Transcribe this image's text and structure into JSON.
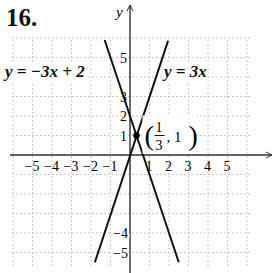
{
  "problem": {
    "number": "16."
  },
  "labels": {
    "eq1": "y = −3x + 2",
    "eq2": "y = 3x",
    "point": "(1/3, 1)",
    "point_num": "1",
    "point_den": "3",
    "point_y": "1",
    "y_axis": "y",
    "x_axis": "x"
  },
  "chart_data": {
    "type": "line",
    "title": "16.",
    "xlabel": "x",
    "ylabel": "y",
    "xlim": [
      -6,
      6
    ],
    "ylim": [
      -5.6,
      6
    ],
    "grid": true,
    "x_tick_labels": [
      "-5",
      "-4",
      "-3",
      "-2",
      "-1",
      "1",
      "2",
      "3",
      "4",
      "5"
    ],
    "y_tick_labels": [
      "5",
      "3",
      "2",
      "1",
      "-4",
      "-5"
    ],
    "series": [
      {
        "name": "y = -3x + 2",
        "slope": -3,
        "intercept": 2,
        "x": [
          -1.3,
          2.5
        ],
        "y": [
          5.9,
          -5.5
        ]
      },
      {
        "name": "y = 3x",
        "slope": 3,
        "intercept": 0,
        "x": [
          -1.8,
          1.95
        ],
        "y": [
          -5.5,
          5.85
        ]
      }
    ],
    "annotations": [
      {
        "text": "(1/3, 1)",
        "x": 0.3333,
        "y": 1,
        "type": "intersection-point"
      }
    ],
    "colors": {
      "line": "#111111",
      "grid": "#bbbbbb",
      "axis": "#333333"
    }
  }
}
